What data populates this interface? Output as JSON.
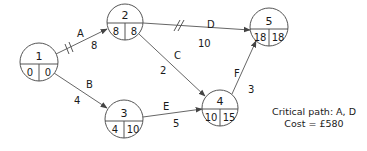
{
  "diagram": {
    "type": "activity-network",
    "nodes": [
      {
        "id": "1",
        "label": "1",
        "earliest": "0",
        "latest": "0",
        "cx": 39,
        "cy": 62,
        "r": 19
      },
      {
        "id": "2",
        "label": "2",
        "earliest": "8",
        "latest": "8",
        "cx": 125,
        "cy": 22,
        "r": 18
      },
      {
        "id": "3",
        "label": "3",
        "earliest": "4",
        "latest": "10",
        "cx": 124,
        "cy": 119,
        "r": 19
      },
      {
        "id": "4",
        "label": "4",
        "earliest": "10",
        "latest": "15",
        "cx": 220,
        "cy": 108,
        "r": 18
      },
      {
        "id": "5",
        "label": "5",
        "earliest": "18",
        "latest": "18",
        "cx": 269,
        "cy": 27,
        "r": 19
      }
    ],
    "edges": [
      {
        "activity": "A",
        "duration": "8",
        "from": "1",
        "to": "2",
        "critical": true
      },
      {
        "activity": "B",
        "duration": "4",
        "from": "1",
        "to": "3",
        "critical": false
      },
      {
        "activity": "C",
        "duration": "2",
        "from": "2",
        "to": "4",
        "critical": false
      },
      {
        "activity": "D",
        "duration": "10",
        "from": "2",
        "to": "5",
        "critical": true
      },
      {
        "activity": "E",
        "duration": "5",
        "from": "3",
        "to": "4",
        "critical": false
      },
      {
        "activity": "F",
        "duration": "3",
        "from": "4",
        "to": "5",
        "critical": false
      }
    ],
    "note": {
      "critical_path": "Critical path: A, D",
      "cost": "Cost = £580"
    }
  }
}
